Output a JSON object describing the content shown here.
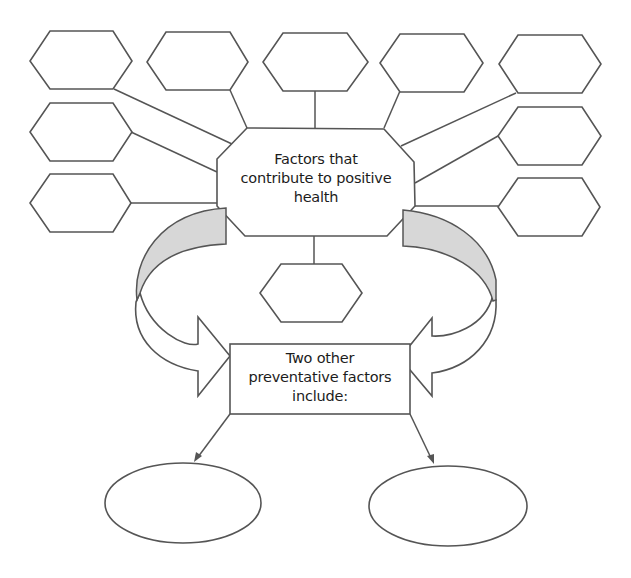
{
  "diagram": {
    "type": "spider-diagram worksheet",
    "central_node": {
      "label_lines": [
        "Factors that",
        "contribute to positive",
        "health"
      ],
      "label": "Factors that contribute to positive health"
    },
    "factor_slots": [
      {
        "id": "hex-top-1",
        "value": ""
      },
      {
        "id": "hex-top-2",
        "value": ""
      },
      {
        "id": "hex-top-3",
        "value": ""
      },
      {
        "id": "hex-top-4",
        "value": ""
      },
      {
        "id": "hex-top-5",
        "value": ""
      },
      {
        "id": "hex-left-2",
        "value": ""
      },
      {
        "id": "hex-left-3",
        "value": ""
      },
      {
        "id": "hex-right-2",
        "value": ""
      },
      {
        "id": "hex-right-3",
        "value": ""
      },
      {
        "id": "hex-bottom",
        "value": ""
      }
    ],
    "preventative_box": {
      "label_lines": [
        "Two other",
        "preventative factors",
        "include:"
      ],
      "label": "Two other preventative factors include:"
    },
    "preventative_slots": [
      {
        "id": "ellipse-left",
        "value": ""
      },
      {
        "id": "ellipse-right",
        "value": ""
      }
    ],
    "colors": {
      "stroke": "#555555",
      "arrow_shade": "#d7d7d7",
      "background": "#ffffff",
      "text": "#1c1c1c"
    }
  }
}
